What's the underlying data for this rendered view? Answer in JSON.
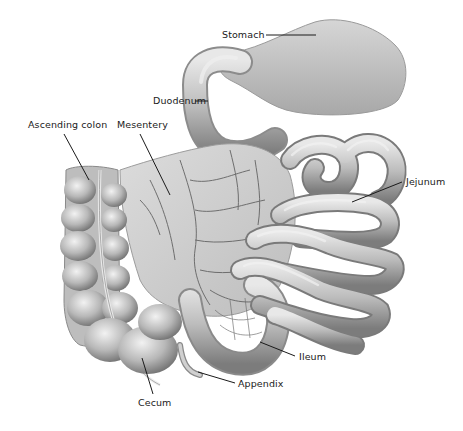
{
  "diagram": {
    "labels": [
      {
        "id": "stomach",
        "text": "Stomach",
        "x": 222,
        "y": 32
      },
      {
        "id": "duodenum",
        "text": "Duodenum",
        "x": 153,
        "y": 97
      },
      {
        "id": "ascending-colon",
        "text": "Ascending colon",
        "x": 28,
        "y": 121
      },
      {
        "id": "mesentery",
        "text": "Mesentery",
        "x": 117,
        "y": 121
      },
      {
        "id": "jejunum",
        "text": "Jejunum",
        "x": 406,
        "y": 178
      },
      {
        "id": "ileum",
        "text": "Ileum",
        "x": 299,
        "y": 352
      },
      {
        "id": "appendix",
        "text": "Appendix",
        "x": 238,
        "y": 379
      },
      {
        "id": "cecum",
        "text": "Cecum",
        "x": 138,
        "y": 399
      }
    ],
    "colors": {
      "background": "#ffffff",
      "organ_fill": "#bdbdbd",
      "organ_light": "#e4e4e4",
      "organ_shadow": "#7a7a7a",
      "vessel": "#5a5a5a",
      "leader_line": "#1a1a1a",
      "text": "#1a1a1a"
    }
  }
}
